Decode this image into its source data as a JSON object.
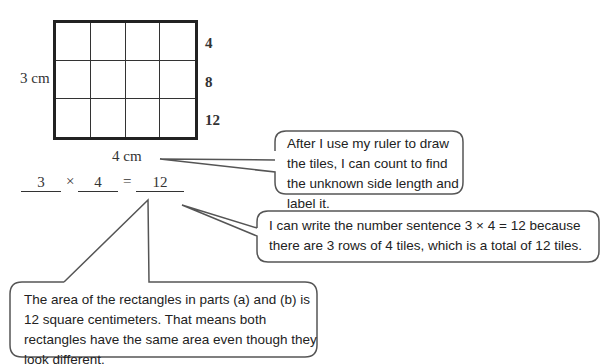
{
  "figure": {
    "grid": {
      "rows": 3,
      "columns": 4
    },
    "side_label_left": "3 cm",
    "side_label_bottom": "4 cm",
    "row_counts": [
      "4",
      "8",
      "12"
    ]
  },
  "equation": {
    "factor1": "3",
    "times": "×",
    "factor2": "4",
    "equals": "=",
    "product": "12"
  },
  "callouts": [
    {
      "text": "After I use my ruler to draw the tiles, I can count to find the unknown side length and label it."
    },
    {
      "text": "I can write the number sentence 3 × 4 = 12 because there are 3 rows of 4 tiles, which is a total of 12 tiles."
    },
    {
      "text": "The area of the rectangles in parts (a) and (b) is 12 square centimeters.  That means both rectangles have the same area even though they look different."
    }
  ]
}
